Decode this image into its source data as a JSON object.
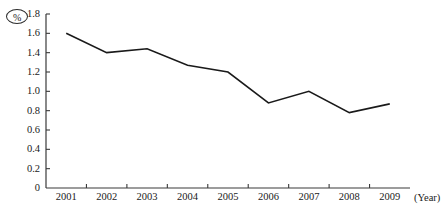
{
  "chart_data": {
    "type": "line",
    "title": "",
    "xlabel": "(Year)",
    "ylabel": "(%)",
    "categories": [
      "2001",
      "2002",
      "2003",
      "2004",
      "2005",
      "2006",
      "2007",
      "2008",
      "2009"
    ],
    "values": [
      1.6,
      1.4,
      1.44,
      1.27,
      1.2,
      0.88,
      1.0,
      0.78,
      0.87
    ],
    "series": [
      {
        "name": "",
        "values": [
          1.6,
          1.4,
          1.44,
          1.27,
          1.2,
          0.88,
          1.0,
          0.78,
          0.87
        ]
      }
    ],
    "ylim": [
      0,
      1.8
    ],
    "ytick_labels": [
      "0",
      "0.2",
      "0.4",
      "0.6",
      "0.8",
      "1.0",
      "1.2",
      "1.4",
      "1.6",
      "1.8"
    ],
    "ytick_values": [
      0,
      0.2,
      0.4,
      0.6,
      0.8,
      1.0,
      1.2,
      1.4,
      1.6,
      1.8
    ],
    "grid": false,
    "legend": "none",
    "line_color": "#1a1a1a",
    "axis_color": "#3a3a3a"
  },
  "labels": {
    "y_unit": "%",
    "x_unit": "(Year)"
  }
}
